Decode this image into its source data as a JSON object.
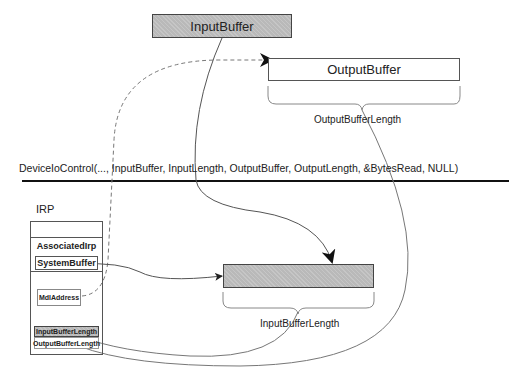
{
  "top": {
    "input_buffer": "InputBuffer",
    "output_buffer": "OutputBuffer",
    "output_buffer_length": "OutputBufferLength"
  },
  "call": {
    "signature": "DeviceIoControl(..., InputBuffer, InputLength, OutputBuffer, OutputLength, &BytesRead, NULL)"
  },
  "kernel": {
    "irp_label": "IRP",
    "associated_irp": "AssociatedIrp",
    "system_buffer": "SystemBuffer",
    "mdl_address": "MdlAddress",
    "input_buffer_length": "InputBufferLength",
    "output_buffer_length": "OutputBufferLength",
    "system_buffer_length_label": "InputBufferLength"
  },
  "colors": {
    "shaded_fill": "#b9b9b9",
    "line": "#555555",
    "divider": "#111111"
  }
}
